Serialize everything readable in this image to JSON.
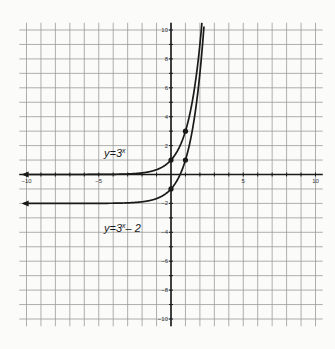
{
  "chart_data": {
    "type": "line",
    "title": "",
    "xlabel": "",
    "ylabel": "",
    "xlim": [
      -10.5,
      10.5
    ],
    "ylim": [
      -10.5,
      10.5
    ],
    "grid": true,
    "grid_step": 1,
    "x_ticks": [
      -10,
      -5,
      5,
      10
    ],
    "y_ticks": [
      10,
      8,
      6,
      4,
      2,
      -2,
      -4,
      -6,
      -8,
      -10
    ],
    "series": [
      {
        "name": "y=3^x",
        "label": "y=3",
        "label_sup": "x",
        "label_suffix": "",
        "function": "3^x",
        "asymptote": 0,
        "points": [
          {
            "x": 0,
            "y": 1
          },
          {
            "x": 1,
            "y": 3
          }
        ]
      },
      {
        "name": "y=3^x-2",
        "label": "y=3",
        "label_sup": "x",
        "label_suffix": "– 2",
        "function": "3^x - 2",
        "asymptote": -2,
        "points": [
          {
            "x": 0,
            "y": -1
          },
          {
            "x": 1,
            "y": 1
          }
        ]
      }
    ],
    "colors": {
      "curve": "#1a1a1a",
      "axis": "#1a1a1a",
      "grid": "#9a9a9a",
      "background": "#fbfbfa"
    }
  }
}
